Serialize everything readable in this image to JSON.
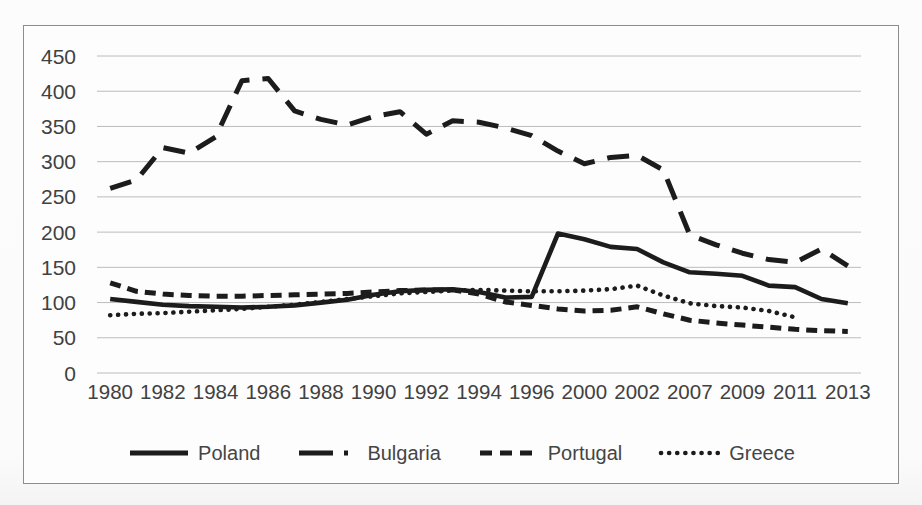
{
  "chart_data": {
    "type": "line",
    "title": "",
    "ylim": [
      0,
      450
    ],
    "y_ticks": [
      450,
      400,
      350,
      300,
      250,
      200,
      150,
      100,
      50,
      0
    ],
    "x_tick_labels": [
      "1980",
      "1982",
      "1984",
      "1986",
      "1988",
      "1990",
      "1992",
      "1994",
      "1996",
      "2000",
      "2002",
      "2007",
      "2009",
      "2011",
      "2013"
    ],
    "x_tick_positions": [
      0,
      2,
      4,
      6,
      8,
      10,
      12,
      14,
      16,
      18,
      20,
      22,
      24,
      26,
      28
    ],
    "num_categories": 29,
    "grid": "horizontal",
    "legend_position": "bottom",
    "series": [
      {
        "name": "Poland",
        "dash": "solid",
        "values": [
          105,
          101,
          97,
          95,
          94,
          93,
          94,
          96,
          100,
          104,
          111,
          116,
          118,
          119,
          115,
          107,
          108,
          198,
          190,
          179,
          176,
          157,
          143,
          141,
          138,
          124,
          122,
          105,
          99
        ]
      },
      {
        "name": "Bulgaria",
        "dash": "long-dash",
        "values": [
          262,
          274,
          320,
          312,
          335,
          415,
          418,
          372,
          360,
          352,
          364,
          371,
          339,
          358,
          356,
          348,
          337,
          315,
          297,
          306,
          309,
          288,
          196,
          182,
          170,
          161,
          157,
          176,
          152
        ]
      },
      {
        "name": "Portugal",
        "dash": "short-dash",
        "values": [
          128,
          116,
          112,
          110,
          109,
          109,
          110,
          111,
          112,
          113,
          115,
          117,
          118,
          118,
          112,
          101,
          96,
          91,
          88,
          89,
          94,
          84,
          75,
          71,
          68,
          65,
          62,
          60,
          59
        ]
      },
      {
        "name": "Greece",
        "dash": "dotted",
        "values": [
          82,
          84,
          85,
          87,
          89,
          91,
          94,
          97,
          101,
          105,
          109,
          113,
          115,
          117,
          118,
          117,
          116,
          116,
          117,
          119,
          124,
          110,
          99,
          95,
          93,
          88,
          79,
          null,
          null
        ]
      }
    ]
  },
  "colors": {
    "line": "#1c1c1c",
    "grid": "#bcbcbc",
    "text": "#414141",
    "frame_border": "#8d8d8d"
  }
}
